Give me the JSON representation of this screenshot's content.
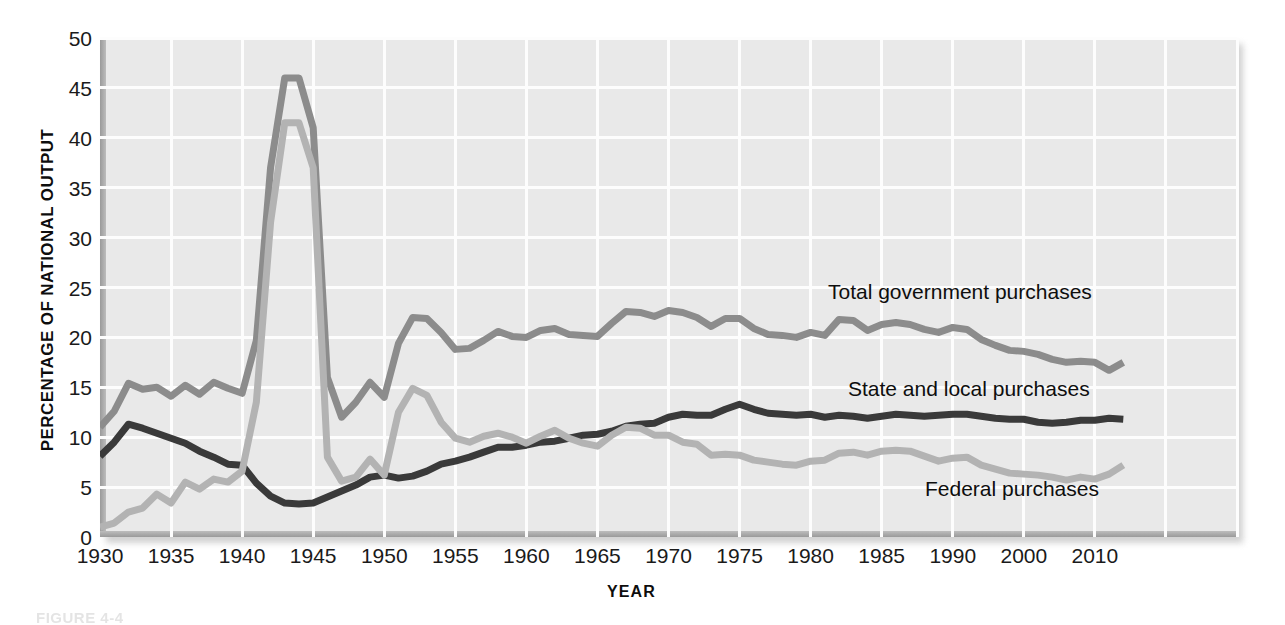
{
  "figure": {
    "caption": "FIGURE 4-4"
  },
  "axes": {
    "ylabel": "PERCENTAGE OF NATIONAL OUTPUT",
    "xlabel": "YEAR",
    "yticks": [
      "50",
      "45",
      "40",
      "35",
      "30",
      "25",
      "20",
      "15",
      "10",
      "5",
      "0"
    ],
    "xticks": [
      "1930",
      "1935",
      "1940",
      "1945",
      "1950",
      "1955",
      "1960",
      "1965",
      "1970",
      "1975",
      "1980",
      "1985",
      "1990",
      "2000",
      "2010"
    ]
  },
  "annotations": {
    "total": "Total government purchases",
    "state_local": "State and local purchases",
    "federal": "Federal purchases"
  },
  "colors": {
    "total": "#8c8c8c",
    "state_local": "#3a3a3a",
    "federal": "#b3b3b3",
    "plot_background": "#e9e9e9",
    "gridline": "#fdfdfd",
    "page_background": "#ffffff"
  },
  "chart_data": {
    "type": "line",
    "title": "",
    "xlabel": "YEAR",
    "ylabel": "PERCENTAGE OF NATIONAL OUTPUT",
    "xlim": [
      1930,
      2010
    ],
    "ylim": [
      0,
      50
    ],
    "ytick_step": 5,
    "xtick_step": 5,
    "grid": true,
    "legend": "inline-annotations",
    "x": [
      1930,
      1931,
      1932,
      1933,
      1934,
      1935,
      1936,
      1937,
      1938,
      1939,
      1940,
      1941,
      1942,
      1943,
      1944,
      1945,
      1946,
      1947,
      1948,
      1949,
      1950,
      1951,
      1952,
      1953,
      1954,
      1955,
      1956,
      1957,
      1958,
      1959,
      1960,
      1961,
      1962,
      1963,
      1964,
      1965,
      1966,
      1967,
      1968,
      1969,
      1970,
      1971,
      1972,
      1973,
      1974,
      1975,
      1976,
      1977,
      1978,
      1979,
      1980,
      1981,
      1982,
      1983,
      1984,
      1985,
      1986,
      1987,
      1988,
      1989,
      1990,
      1991,
      1992,
      1993,
      1994,
      1995,
      1996,
      1997,
      1998,
      1999,
      2000,
      2001,
      2002
    ],
    "series": [
      {
        "name": "Total government purchases",
        "color": "#8c8c8c",
        "values": [
          11.0,
          12.6,
          15.4,
          14.8,
          15.0,
          14.1,
          15.2,
          14.3,
          15.5,
          14.9,
          14.4,
          19.7,
          37.0,
          46.0,
          46.0,
          41.0,
          16.0,
          12.0,
          13.5,
          15.5,
          14.0,
          19.4,
          22.0,
          21.9,
          20.5,
          18.8,
          18.9,
          19.7,
          20.6,
          20.1,
          20.0,
          20.7,
          20.9,
          20.3,
          20.2,
          20.1,
          21.4,
          22.6,
          22.5,
          22.1,
          22.7,
          22.5,
          22.0,
          21.1,
          21.9,
          21.9,
          20.9,
          20.3,
          20.2,
          20.0,
          20.5,
          20.2,
          21.8,
          21.7,
          20.7,
          21.3,
          21.5,
          21.3,
          20.8,
          20.5,
          21.0,
          20.8,
          19.8,
          19.2,
          18.7,
          18.6,
          18.3,
          17.8,
          17.5,
          17.6,
          17.5,
          16.7,
          17.5
        ]
      },
      {
        "name": "State and local purchases",
        "color": "#3a3a3a",
        "values": [
          8.1,
          9.5,
          11.3,
          10.9,
          10.4,
          9.9,
          9.4,
          8.6,
          8.0,
          7.3,
          7.2,
          5.4,
          4.1,
          3.4,
          3.3,
          3.4,
          4.0,
          4.6,
          5.2,
          6.0,
          6.2,
          5.9,
          6.1,
          6.6,
          7.3,
          7.6,
          8.0,
          8.5,
          9.0,
          9.0,
          9.2,
          9.5,
          9.6,
          9.9,
          10.2,
          10.3,
          10.6,
          11.1,
          11.3,
          11.4,
          12.0,
          12.3,
          12.2,
          12.2,
          12.8,
          13.3,
          12.8,
          12.4,
          12.3,
          12.2,
          12.3,
          12.0,
          12.2,
          12.1,
          11.9,
          12.1,
          12.3,
          12.2,
          12.1,
          12.2,
          12.3,
          12.3,
          12.1,
          11.9,
          11.8,
          11.8,
          11.5,
          11.4,
          11.5,
          11.7,
          11.7,
          11.9,
          11.8
        ]
      },
      {
        "name": "Federal purchases",
        "color": "#b3b3b3",
        "values": [
          1.0,
          1.4,
          2.5,
          2.9,
          4.3,
          3.4,
          5.5,
          4.8,
          5.8,
          5.5,
          6.6,
          13.5,
          31.5,
          41.5,
          41.5,
          37.0,
          8.0,
          5.6,
          6.0,
          7.8,
          6.2,
          12.5,
          14.9,
          14.2,
          11.5,
          9.9,
          9.5,
          10.1,
          10.4,
          10.0,
          9.4,
          10.1,
          10.7,
          9.9,
          9.4,
          9.1,
          10.2,
          11.0,
          10.9,
          10.2,
          10.2,
          9.5,
          9.3,
          8.2,
          8.3,
          8.2,
          7.7,
          7.5,
          7.3,
          7.2,
          7.6,
          7.7,
          8.4,
          8.5,
          8.2,
          8.6,
          8.7,
          8.6,
          8.1,
          7.6,
          7.9,
          8.0,
          7.2,
          6.8,
          6.4,
          6.3,
          6.2,
          6.0,
          5.7,
          6.0,
          5.8,
          6.3,
          7.2
        ]
      }
    ]
  }
}
